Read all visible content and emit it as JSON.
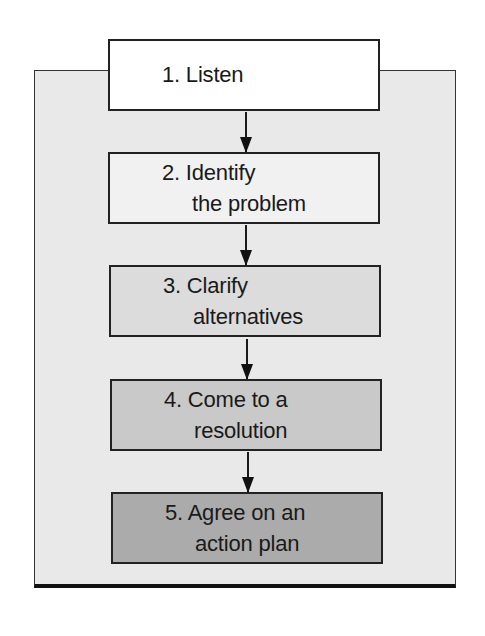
{
  "diagram": {
    "type": "flowchart",
    "direction": "top-to-bottom",
    "panel_color": "#e9e9e9",
    "steps": [
      {
        "number": "1.",
        "line1": "1. Listen",
        "line2": "",
        "fill": "#ffffff"
      },
      {
        "number": "2.",
        "line1": "2. Identify",
        "line2": "the problem",
        "fill": "#f1f1f1"
      },
      {
        "number": "3.",
        "line1": "3. Clarify",
        "line2": "alternatives",
        "fill": "#dcdcdc"
      },
      {
        "number": "4.",
        "line1": "4. Come to a",
        "line2": "resolution",
        "fill": "#c9c9c9"
      },
      {
        "number": "5.",
        "line1": "5. Agree on an",
        "line2": "action plan",
        "fill": "#ababab"
      }
    ],
    "connectors": [
      {
        "from": 1,
        "to": 2,
        "icon": "arrow-down-icon"
      },
      {
        "from": 2,
        "to": 3,
        "icon": "arrow-down-icon"
      },
      {
        "from": 3,
        "to": 4,
        "icon": "arrow-down-icon"
      },
      {
        "from": 4,
        "to": 5,
        "icon": "arrow-down-icon"
      }
    ]
  }
}
